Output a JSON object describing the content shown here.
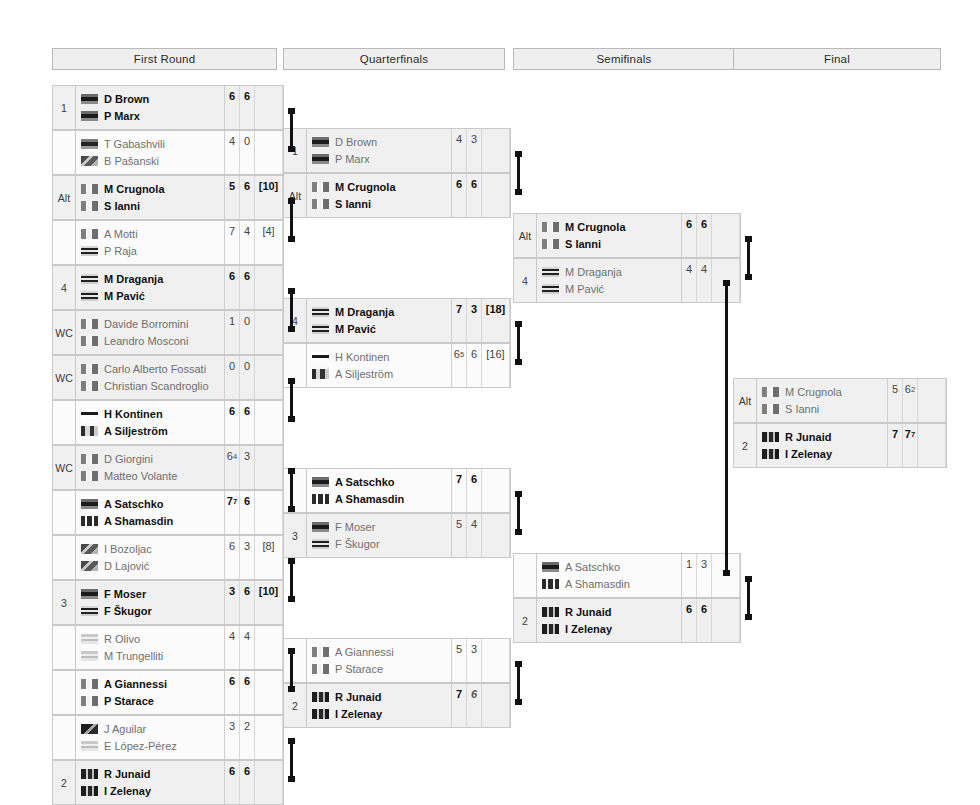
{
  "rounds": [
    {
      "label": "First Round"
    },
    {
      "label": "Quarterfinals"
    },
    {
      "label": "Semifinals"
    },
    {
      "label": "Final"
    }
  ],
  "first_round": [
    {
      "seed": "1",
      "winner": true,
      "p1": {
        "name": "D Brown",
        "flag": "flag-dark"
      },
      "p2": {
        "name": "P Marx",
        "flag": "flag-dark"
      },
      "scores": [
        {
          "v": "6"
        },
        {
          "v": "6"
        },
        {
          "v": ""
        }
      ]
    },
    {
      "seed": "",
      "winner": false,
      "p1": {
        "name": "T Gabashvili",
        "flag": "flag-dark-small"
      },
      "p2": {
        "name": "B Pašanski",
        "flag": "flag-mottled"
      },
      "scores": [
        {
          "v": "4"
        },
        {
          "v": "0"
        },
        {
          "v": ""
        }
      ]
    },
    {
      "seed": "Alt",
      "winner": true,
      "p1": {
        "name": "M Crugnola",
        "flag": "flag-stripes"
      },
      "p2": {
        "name": "S Ianni",
        "flag": "flag-stripes"
      },
      "scores": [
        {
          "v": "5"
        },
        {
          "v": "6"
        },
        {
          "v": "[10]"
        }
      ]
    },
    {
      "seed": "",
      "winner": false,
      "p1": {
        "name": "A Motti",
        "flag": "flag-stripes"
      },
      "p2": {
        "name": "P Raja",
        "flag": "flag-bars"
      },
      "scores": [
        {
          "v": "7"
        },
        {
          "v": "4"
        },
        {
          "v": "[4]"
        }
      ]
    },
    {
      "seed": "4",
      "winner": true,
      "p1": {
        "name": "M Draganja",
        "flag": "flag-bars"
      },
      "p2": {
        "name": "M Pavić",
        "flag": "flag-bars"
      },
      "scores": [
        {
          "v": "6"
        },
        {
          "v": "6"
        },
        {
          "v": ""
        }
      ]
    },
    {
      "seed": "WC",
      "winner": false,
      "p1": {
        "name": "Davide Borromini",
        "flag": "flag-stripes"
      },
      "p2": {
        "name": "Leandro Mosconi",
        "flag": "flag-stripes"
      },
      "scores": [
        {
          "v": "1"
        },
        {
          "v": "0"
        },
        {
          "v": ""
        }
      ]
    },
    {
      "seed": "WC",
      "winner": false,
      "p1": {
        "name": "Carlo Alberto Fossati",
        "flag": "flag-stripes"
      },
      "p2": {
        "name": "Christian Scandroglio",
        "flag": "flag-stripes"
      },
      "scores": [
        {
          "v": "0"
        },
        {
          "v": "0"
        },
        {
          "v": ""
        }
      ]
    },
    {
      "seed": "",
      "winner": true,
      "p1": {
        "name": "H Kontinen",
        "flag": "flag-cross"
      },
      "p2": {
        "name": "A Siljeström",
        "flag": "flag-checks"
      },
      "scores": [
        {
          "v": "6"
        },
        {
          "v": "6"
        },
        {
          "v": ""
        }
      ]
    },
    {
      "seed": "WC",
      "winner": false,
      "p1": {
        "name": "D Giorgini",
        "flag": "flag-stripes"
      },
      "p2": {
        "name": "Matteo Volante",
        "flag": "flag-stripes"
      },
      "scores": [
        {
          "v": "6",
          "sup": "4"
        },
        {
          "v": "3"
        },
        {
          "v": ""
        }
      ]
    },
    {
      "seed": "",
      "winner": true,
      "p1": {
        "name": "A Satschko",
        "flag": "flag-dark"
      },
      "p2": {
        "name": "A Shamasdin",
        "flag": "flag-maple"
      },
      "scores": [
        {
          "v": "7",
          "sup": "7"
        },
        {
          "v": "6"
        },
        {
          "v": ""
        }
      ]
    },
    {
      "seed": "",
      "winner": false,
      "p1": {
        "name": "I Bozoljac",
        "flag": "flag-mottled"
      },
      "p2": {
        "name": "D Lajović",
        "flag": "flag-mottled"
      },
      "scores": [
        {
          "v": "6"
        },
        {
          "v": "3"
        },
        {
          "v": "[8]"
        }
      ]
    },
    {
      "seed": "3",
      "winner": true,
      "p1": {
        "name": "F Moser",
        "flag": "flag-dark"
      },
      "p2": {
        "name": "F Škugor",
        "flag": "flag-bars"
      },
      "scores": [
        {
          "v": "3"
        },
        {
          "v": "6"
        },
        {
          "v": "[10]"
        }
      ]
    },
    {
      "seed": "",
      "winner": false,
      "p1": {
        "name": "R Olivo",
        "flag": "flag-light-bars"
      },
      "p2": {
        "name": "M Trungelliti",
        "flag": "flag-light-bars"
      },
      "scores": [
        {
          "v": "4"
        },
        {
          "v": "4"
        },
        {
          "v": ""
        }
      ]
    },
    {
      "seed": "",
      "winner": true,
      "p1": {
        "name": "A Giannessi",
        "flag": "flag-stripes"
      },
      "p2": {
        "name": "P Starace",
        "flag": "flag-stripes"
      },
      "scores": [
        {
          "v": "6"
        },
        {
          "v": "6"
        },
        {
          "v": ""
        }
      ]
    },
    {
      "seed": "",
      "winner": false,
      "p1": {
        "name": "J Aguilar",
        "flag": "flag-corner"
      },
      "p2": {
        "name": "E López-Pérez",
        "flag": "flag-light-bars"
      },
      "scores": [
        {
          "v": "3"
        },
        {
          "v": "2"
        },
        {
          "v": ""
        }
      ]
    },
    {
      "seed": "2",
      "winner": true,
      "p1": {
        "name": "R Junaid",
        "flag": "flag-speck"
      },
      "p2": {
        "name": "I Zelenay",
        "flag": "flag-speck"
      },
      "scores": [
        {
          "v": "6"
        },
        {
          "v": "6"
        },
        {
          "v": ""
        }
      ]
    }
  ],
  "quarterfinals": [
    {
      "seed": "1",
      "winner": false,
      "p1": {
        "name": "D Brown",
        "flag": "flag-dark"
      },
      "p2": {
        "name": "P Marx",
        "flag": "flag-dark"
      },
      "scores": [
        {
          "v": "4"
        },
        {
          "v": "3"
        },
        {
          "v": ""
        }
      ]
    },
    {
      "seed": "Alt",
      "winner": true,
      "p1": {
        "name": "M Crugnola",
        "flag": "flag-stripes"
      },
      "p2": {
        "name": "S Ianni",
        "flag": "flag-stripes"
      },
      "scores": [
        {
          "v": "6"
        },
        {
          "v": "6"
        },
        {
          "v": ""
        }
      ]
    },
    {
      "seed": "4",
      "winner": true,
      "p1": {
        "name": "M Draganja",
        "flag": "flag-bars"
      },
      "p2": {
        "name": "M Pavić",
        "flag": "flag-bars"
      },
      "scores": [
        {
          "v": "7"
        },
        {
          "v": "3"
        },
        {
          "v": "[18]"
        }
      ]
    },
    {
      "seed": "",
      "winner": false,
      "p1": {
        "name": "H Kontinen",
        "flag": "flag-cross"
      },
      "p2": {
        "name": "A Siljeström",
        "flag": "flag-checks"
      },
      "scores": [
        {
          "v": "6",
          "sup": "5"
        },
        {
          "v": "6"
        },
        {
          "v": "[16]"
        }
      ]
    },
    {
      "seed": "",
      "winner": true,
      "p1": {
        "name": "A Satschko",
        "flag": "flag-dark"
      },
      "p2": {
        "name": "A Shamasdin",
        "flag": "flag-maple"
      },
      "scores": [
        {
          "v": "7"
        },
        {
          "v": "6"
        },
        {
          "v": ""
        }
      ]
    },
    {
      "seed": "3",
      "winner": false,
      "p1": {
        "name": "F Moser",
        "flag": "flag-dark"
      },
      "p2": {
        "name": "F Škugor",
        "flag": "flag-bars"
      },
      "scores": [
        {
          "v": "5"
        },
        {
          "v": "4"
        },
        {
          "v": ""
        }
      ]
    },
    {
      "seed": "",
      "winner": false,
      "p1": {
        "name": "A Giannessi",
        "flag": "flag-stripes"
      },
      "p2": {
        "name": "P Starace",
        "flag": "flag-stripes"
      },
      "scores": [
        {
          "v": "5"
        },
        {
          "v": "3"
        },
        {
          "v": ""
        }
      ]
    },
    {
      "seed": "2",
      "winner": true,
      "p1": {
        "name": "R Junaid",
        "flag": "flag-speck"
      },
      "p2": {
        "name": "I Zelenay",
        "flag": "flag-speck"
      },
      "scores": [
        {
          "v": "7"
        },
        {
          "v": "6",
          "italic": true
        },
        {
          "v": ""
        }
      ]
    }
  ],
  "semifinals": [
    {
      "seed": "Alt",
      "winner": true,
      "p1": {
        "name": "M Crugnola",
        "flag": "flag-stripes"
      },
      "p2": {
        "name": "S Ianni",
        "flag": "flag-stripes"
      },
      "scores": [
        {
          "v": "6"
        },
        {
          "v": "6"
        },
        {
          "v": ""
        }
      ]
    },
    {
      "seed": "4",
      "winner": false,
      "p1": {
        "name": "M Draganja",
        "flag": "flag-bars"
      },
      "p2": {
        "name": "M Pavić",
        "flag": "flag-bars"
      },
      "scores": [
        {
          "v": "4"
        },
        {
          "v": "4"
        },
        {
          "v": ""
        }
      ]
    },
    {
      "seed": "",
      "winner": false,
      "p1": {
        "name": "A Satschko",
        "flag": "flag-dark"
      },
      "p2": {
        "name": "A Shamasdin",
        "flag": "flag-maple"
      },
      "scores": [
        {
          "v": "1"
        },
        {
          "v": "3"
        },
        {
          "v": ""
        }
      ]
    },
    {
      "seed": "2",
      "winner": true,
      "p1": {
        "name": "R Junaid",
        "flag": "flag-speck"
      },
      "p2": {
        "name": "I Zelenay",
        "flag": "flag-speck"
      },
      "scores": [
        {
          "v": "6"
        },
        {
          "v": "6"
        },
        {
          "v": ""
        }
      ]
    }
  ],
  "final": [
    {
      "seed": "Alt",
      "winner": false,
      "p1": {
        "name": "M Crugnola",
        "flag": "flag-stripes"
      },
      "p2": {
        "name": "S Ianni",
        "flag": "flag-stripes"
      },
      "scores": [
        {
          "v": "5"
        },
        {
          "v": "6",
          "sup": "2"
        },
        {
          "v": ""
        }
      ]
    },
    {
      "seed": "2",
      "winner": true,
      "p1": {
        "name": "R Junaid",
        "flag": "flag-speck"
      },
      "p2": {
        "name": "I Zelenay",
        "flag": "flag-speck"
      },
      "scores": [
        {
          "v": "7"
        },
        {
          "v": "7",
          "sup": "7"
        },
        {
          "v": ""
        }
      ]
    }
  ]
}
